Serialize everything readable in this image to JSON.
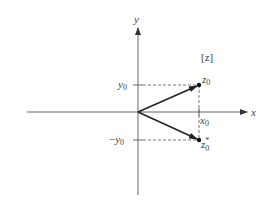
{
  "diagram": {
    "type": "complex-plane",
    "axes": {
      "x_label": "x",
      "y_label": "y",
      "plane_label": "[z]"
    },
    "points": [
      {
        "name": "z0",
        "label_base": "z",
        "label_sub": "0",
        "label_sup": "",
        "x_coord": "x0",
        "y_coord": "y0"
      },
      {
        "name": "z0_conjugate",
        "label_base": "z",
        "label_sub": "0",
        "label_sup": "*",
        "x_coord": "x0",
        "y_coord": "-y0"
      }
    ],
    "tick_labels": {
      "x0": {
        "base": "x",
        "sub": "0"
      },
      "y0": {
        "base": "y",
        "sub": "0"
      },
      "neg_y0": {
        "prefix": "−",
        "base": "y",
        "sub": "0"
      }
    },
    "colors": {
      "axis": "#666666",
      "vector": "#222222",
      "dashed": "#555555",
      "text": "#444444"
    }
  }
}
